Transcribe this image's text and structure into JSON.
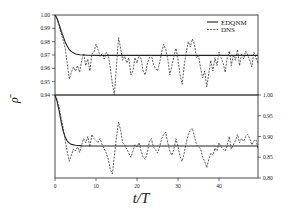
{
  "chart_data": [
    {
      "type": "line",
      "panel": "top",
      "title": "",
      "xlabel": "t/T",
      "ylabel": "ρ̄",
      "xlim": [
        0,
        49.5
      ],
      "ylim": [
        0.94,
        1.0
      ],
      "y_axis_side": "left",
      "yticks": [
        1.0,
        0.99,
        0.98,
        0.97,
        0.96,
        0.95,
        0.94
      ],
      "ytick_labels": [
        "1.00",
        "0.99",
        "0.98",
        "0.97",
        "0.96",
        "0.95",
        "0.94"
      ],
      "grid": false,
      "legend": {
        "position": "upper right",
        "entries": [
          "EDQNM",
          "DNS"
        ]
      },
      "series": [
        {
          "name": "EDQNM",
          "style": "solid",
          "x": [
            0,
            0.5,
            1,
            1.5,
            2,
            2.5,
            3,
            3.5,
            4,
            5,
            6,
            7,
            8,
            10,
            49.5
          ],
          "y": [
            1.0,
            0.9975,
            0.993,
            0.988,
            0.984,
            0.9795,
            0.9765,
            0.974,
            0.9725,
            0.9708,
            0.9702,
            0.97,
            0.9698,
            0.9697,
            0.9697
          ]
        },
        {
          "name": "DNS",
          "style": "dashed",
          "x": [
            0,
            0.5,
            1,
            1.5,
            2,
            2.5,
            3,
            3.5,
            4,
            4.5,
            5,
            5.5,
            6,
            6.5,
            7,
            7.5,
            8,
            8.5,
            9,
            9.5,
            10,
            10.5,
            11,
            11.5,
            12,
            12.5,
            13,
            13.5,
            14,
            14.5,
            15,
            15.5,
            16,
            16.5,
            17,
            17.5,
            18,
            18.5,
            19,
            19.5,
            20,
            20.5,
            21,
            21.5,
            22,
            22.5,
            23,
            23.5,
            24,
            24.5,
            25,
            25.5,
            26,
            26.5,
            27,
            27.5,
            28,
            28.5,
            29,
            29.5,
            30,
            30.5,
            31,
            31.5,
            32,
            32.5,
            33,
            33.5,
            34,
            34.5,
            35,
            35.5,
            36,
            36.5,
            37,
            37.5,
            38,
            38.5,
            39,
            39.5,
            40,
            40.5,
            41,
            41.5,
            42,
            42.5,
            43,
            43.5,
            44,
            44.5,
            45,
            45.5,
            46,
            46.5,
            47,
            47.5,
            48,
            48.5,
            49,
            49.5
          ],
          "y": [
            1.0,
            0.997,
            0.992,
            0.986,
            0.981,
            0.975,
            0.963,
            0.952,
            0.957,
            0.961,
            0.958,
            0.962,
            0.957,
            0.966,
            0.971,
            0.962,
            0.967,
            0.958,
            0.971,
            0.972,
            0.978,
            0.974,
            0.969,
            0.971,
            0.967,
            0.972,
            0.97,
            0.96,
            0.948,
            0.94,
            0.962,
            0.983,
            0.975,
            0.966,
            0.969,
            0.964,
            0.968,
            0.955,
            0.958,
            0.968,
            0.964,
            0.97,
            0.967,
            0.958,
            0.955,
            0.963,
            0.968,
            0.97,
            0.963,
            0.96,
            0.958,
            0.964,
            0.972,
            0.978,
            0.974,
            0.967,
            0.955,
            0.962,
            0.969,
            0.975,
            0.966,
            0.955,
            0.948,
            0.962,
            0.972,
            0.98,
            0.976,
            0.982,
            0.978,
            0.968,
            0.97,
            0.96,
            0.953,
            0.958,
            0.946,
            0.956,
            0.966,
            0.958,
            0.968,
            0.962,
            0.972,
            0.968,
            0.964,
            0.957,
            0.968,
            0.973,
            0.962,
            0.97,
            0.966,
            0.974,
            0.962,
            0.971,
            0.967,
            0.973,
            0.97,
            0.966,
            0.961,
            0.972,
            0.968,
            0.964,
            0.97,
            0.966,
            0.962,
            0.958
          ]
        }
      ]
    },
    {
      "type": "line",
      "panel": "bottom",
      "title": "",
      "xlabel": "t/T",
      "ylabel": "ρ̄",
      "xlim": [
        0,
        49.5
      ],
      "ylim": [
        0.8,
        1.0
      ],
      "y_axis_side": "right",
      "yticks": [
        1.0,
        0.95,
        0.9,
        0.85,
        0.8
      ],
      "ytick_labels": [
        "1.00",
        "0.95",
        "0.90",
        "0.85",
        "0.80"
      ],
      "xticks": [
        0,
        10,
        20,
        30,
        40
      ],
      "xtick_labels": [
        "0",
        "10",
        "20",
        "30",
        "40"
      ],
      "grid": false,
      "series": [
        {
          "name": "EDQNM",
          "style": "solid",
          "x": [
            0,
            0.5,
            1,
            1.5,
            2,
            2.5,
            3,
            3.5,
            4,
            5,
            6,
            7,
            8,
            10,
            49.5
          ],
          "y": [
            1.0,
            0.985,
            0.962,
            0.935,
            0.913,
            0.898,
            0.889,
            0.884,
            0.881,
            0.879,
            0.878,
            0.877,
            0.877,
            0.877,
            0.877
          ]
        },
        {
          "name": "DNS",
          "style": "dashed",
          "x": [
            0,
            0.5,
            1,
            1.5,
            2,
            2.5,
            3,
            3.5,
            4,
            4.5,
            5,
            5.5,
            6,
            6.5,
            7,
            7.5,
            8,
            8.5,
            9,
            9.5,
            10,
            10.5,
            11,
            11.5,
            12,
            12.5,
            13,
            13.5,
            14,
            14.5,
            15,
            15.5,
            16,
            16.5,
            17,
            17.5,
            18,
            18.5,
            19,
            19.5,
            20,
            20.5,
            21,
            21.5,
            22,
            22.5,
            23,
            23.5,
            24,
            24.5,
            25,
            25.5,
            26,
            26.5,
            27,
            27.5,
            28,
            28.5,
            29,
            29.5,
            30,
            30.5,
            31,
            31.5,
            32,
            32.5,
            33,
            33.5,
            34,
            34.5,
            35,
            35.5,
            36,
            36.5,
            37,
            37.5,
            38,
            38.5,
            39,
            39.5,
            40,
            40.5,
            41,
            41.5,
            42,
            42.5,
            43,
            43.5,
            44,
            44.5,
            45,
            45.5,
            46,
            46.5,
            47,
            47.5,
            48,
            48.5,
            49,
            49.5
          ],
          "y": [
            1.0,
            0.99,
            0.97,
            0.945,
            0.92,
            0.89,
            0.862,
            0.84,
            0.855,
            0.87,
            0.865,
            0.875,
            0.862,
            0.88,
            0.895,
            0.885,
            0.9,
            0.875,
            0.905,
            0.895,
            0.89,
            0.885,
            0.895,
            0.88,
            0.87,
            0.86,
            0.845,
            0.82,
            0.81,
            0.855,
            0.9,
            0.935,
            0.915,
            0.885,
            0.88,
            0.87,
            0.86,
            0.85,
            0.865,
            0.88,
            0.875,
            0.885,
            0.865,
            0.85,
            0.845,
            0.86,
            0.888,
            0.895,
            0.875,
            0.868,
            0.86,
            0.875,
            0.895,
            0.905,
            0.91,
            0.885,
            0.865,
            0.855,
            0.87,
            0.895,
            0.875,
            0.852,
            0.84,
            0.86,
            0.885,
            0.905,
            0.915,
            0.92,
            0.9,
            0.88,
            0.875,
            0.87,
            0.85,
            0.84,
            0.825,
            0.845,
            0.86,
            0.855,
            0.872,
            0.865,
            0.885,
            0.875,
            0.87,
            0.865,
            0.88,
            0.9,
            0.87,
            0.88,
            0.89,
            0.905,
            0.885,
            0.895,
            0.888,
            0.9,
            0.905,
            0.895,
            0.88,
            0.89,
            0.892,
            0.87,
            0.882,
            0.875,
            0.86,
            0.865
          ]
        }
      ]
    }
  ],
  "legend": {
    "edqnm_label": "EDQNM",
    "dns_label": "DNS"
  },
  "axes": {
    "xlabel": "t/T",
    "ylabel": "ρ̄"
  }
}
